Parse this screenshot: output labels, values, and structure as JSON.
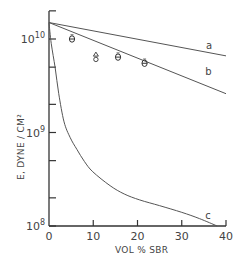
{
  "chart_data": {
    "type": "line",
    "title": "",
    "xlabel": "VOL % SBR",
    "ylabel": "E, DYNE / CM²",
    "yscale": "log",
    "xlim": [
      0,
      40
    ],
    "ylim": [
      100000000.0,
      20000000000.0
    ],
    "grid": false,
    "x_ticks": [
      {
        "value": 0,
        "label": "0"
      },
      {
        "value": 10,
        "label": "10"
      },
      {
        "value": 20,
        "label": "20"
      },
      {
        "value": 30,
        "label": "30"
      },
      {
        "value": 40,
        "label": "40"
      }
    ],
    "y_ticks": [
      {
        "value": 100000000.0,
        "base": "10",
        "exp": "8",
        "labeled": true
      },
      {
        "value": 200000000.0,
        "labeled": false
      },
      {
        "value": 500000000.0,
        "labeled": false
      },
      {
        "value": 1000000000.0,
        "base": "10",
        "exp": "9",
        "labeled": true
      },
      {
        "value": 2000000000.0,
        "labeled": false
      },
      {
        "value": 5000000000.0,
        "labeled": false
      },
      {
        "value": 10000000000.0,
        "base": "10",
        "exp": "10",
        "labeled": true
      },
      {
        "value": 20000000000.0,
        "labeled": false
      }
    ],
    "series": [
      {
        "name": "a",
        "style": "line",
        "x": [
          0,
          40
        ],
        "y": [
          15000000000.0,
          6600000000.0
        ],
        "label_pos": [
          35.5,
          7800000000.0
        ]
      },
      {
        "name": "b",
        "style": "line",
        "x": [
          0,
          40
        ],
        "y": [
          15000000000.0,
          2600000000.0
        ],
        "label_pos": [
          35.3,
          4100000000.0
        ]
      },
      {
        "name": "c",
        "style": "line",
        "x": [
          0,
          0.5,
          1.4,
          2.2,
          3.4,
          4.8,
          6.3,
          8.0,
          9.9,
          13.8,
          17.0,
          20.5,
          25.0,
          30.0,
          34.0,
          38.0
        ],
        "y": [
          15000000000.0,
          9000000000.0,
          4900000000.0,
          2600000000.0,
          1300000000.0,
          880000000.0,
          660000000.0,
          490000000.0,
          380000000.0,
          270000000.0,
          220000000.0,
          190000000.0,
          165000000.0,
          140000000.0,
          120000000.0,
          100000000.0
        ],
        "label_pos": [
          35.3,
          120000000.0
        ]
      },
      {
        "name": "experimental",
        "style": "markers",
        "points": [
          {
            "x": 5.2,
            "y": 10000000000.0,
            "marker": "theta"
          },
          {
            "x": 10.6,
            "y": 6400000000.0,
            "marker": "triangle-over-circle"
          },
          {
            "x": 15.6,
            "y": 6400000000.0,
            "marker": "theta"
          },
          {
            "x": 21.6,
            "y": 5500000000.0,
            "marker": "theta"
          }
        ]
      }
    ]
  }
}
